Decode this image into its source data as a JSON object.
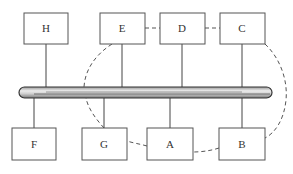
{
  "diagram": {
    "type": "bus-topology",
    "top_nodes": [
      {
        "id": "H",
        "label": "H",
        "x": 24,
        "y": 13,
        "w": 44,
        "h": 31,
        "tap_x": 46
      },
      {
        "id": "E",
        "label": "E",
        "x": 100,
        "y": 13,
        "w": 45,
        "h": 31,
        "tap_x": 122
      },
      {
        "id": "D",
        "label": "D",
        "x": 160,
        "y": 13,
        "w": 45,
        "h": 31,
        "tap_x": 182
      },
      {
        "id": "C",
        "label": "C",
        "x": 220,
        "y": 13,
        "w": 45,
        "h": 31,
        "tap_x": 242
      }
    ],
    "bottom_nodes": [
      {
        "id": "F",
        "label": "F",
        "x": 12,
        "y": 128,
        "w": 44,
        "h": 32,
        "tap_x": 34
      },
      {
        "id": "G",
        "label": "G",
        "x": 82,
        "y": 128,
        "w": 45,
        "h": 32,
        "tap_x": 104
      },
      {
        "id": "A",
        "label": "A",
        "x": 147,
        "y": 128,
        "w": 46,
        "h": 32,
        "tap_x": 170
      },
      {
        "id": "B",
        "label": "B",
        "x": 219,
        "y": 128,
        "w": 46,
        "h": 32,
        "tap_x": 242
      }
    ],
    "bus": {
      "x1": 19,
      "x2": 272,
      "y": 92,
      "thickness": 11
    },
    "dashed_group": {
      "description": "dashed loop enclosing E, D, C, B, A, G",
      "members": [
        "E",
        "D",
        "C",
        "B",
        "A",
        "G"
      ]
    },
    "colors": {
      "line": "#444444",
      "box_border": "#555555",
      "bus_fill_light": "#e4e4e4",
      "bus_fill_dark": "#8a8a8a",
      "dashed": "#555555"
    }
  }
}
